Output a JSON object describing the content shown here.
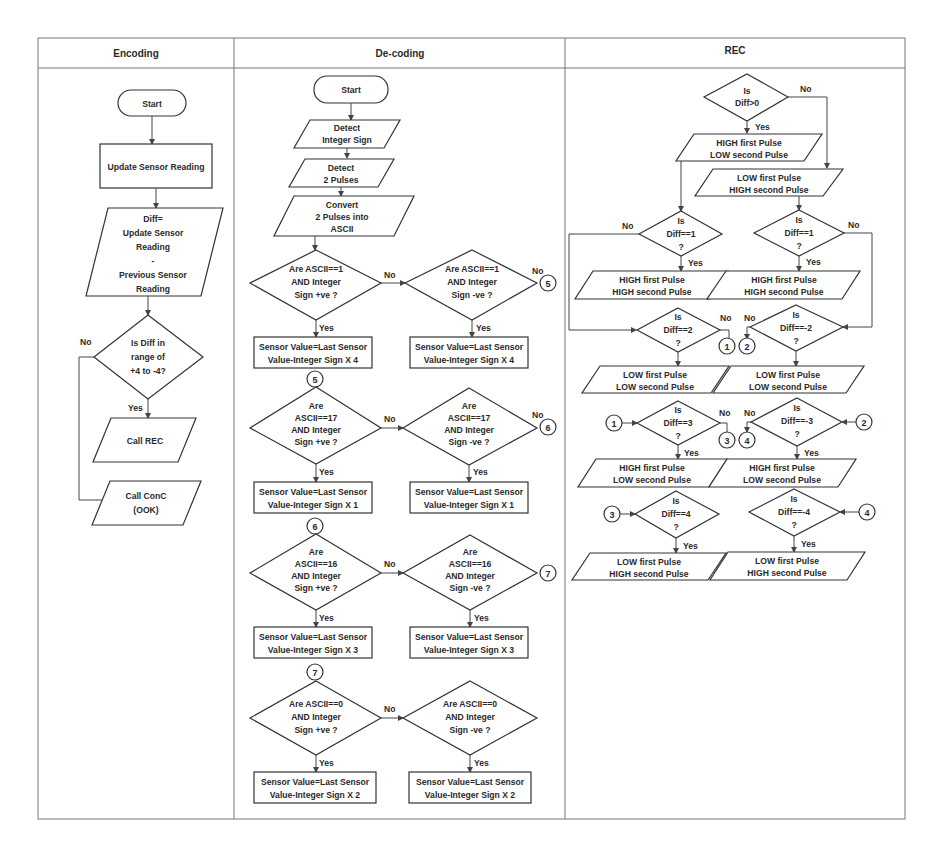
{
  "table": {
    "columns": [
      "Encoding",
      "De-coding",
      "REC"
    ]
  },
  "encoding": {
    "start": "Start",
    "update": "Update Sensor Reading",
    "diff": [
      "Diff=",
      "Update Sensor",
      "Reading",
      "-",
      "Previous Sensor",
      "Reading"
    ],
    "decision": [
      "Is Diff  in",
      "range of",
      "+4 to -4?"
    ],
    "no": "No",
    "yes": "Yes",
    "call_rec": "Call REC",
    "call_conc": [
      "Call ConC",
      "(OOK)"
    ]
  },
  "decoding": {
    "start": "Start",
    "detect_sign": [
      "Detect",
      "Integer Sign"
    ],
    "detect_pulses": [
      "Detect",
      "2 Pulses"
    ],
    "convert": [
      "Convert",
      "2 Pulses into",
      "ASCII"
    ],
    "rows": [
      {
        "connector_in": "",
        "left_decision": [
          "Are ASCII==1",
          "AND Integer",
          "Sign +ve ?"
        ],
        "right_decision": [
          "Are ASCII==1",
          "AND Integer",
          "Sign -ve ?"
        ],
        "left_result": [
          "Sensor Value=Last Sensor",
          "Value-Integer Sign X 4"
        ],
        "right_result": [
          "Sensor Value=Last Sensor",
          "Value-Integer Sign X 4"
        ],
        "connector_out": "5"
      },
      {
        "connector_in": "5",
        "left_decision": [
          "Are",
          "ASCII==17",
          "AND Integer",
          "Sign +ve ?"
        ],
        "right_decision": [
          "Are",
          "ASCII==17",
          "AND Integer",
          "Sign -ve ?"
        ],
        "left_result": [
          "Sensor Value=Last Sensor",
          "Value-Integer Sign X 1"
        ],
        "right_result": [
          "Sensor Value=Last Sensor",
          "Value-Integer Sign X 1"
        ],
        "connector_out": "6"
      },
      {
        "connector_in": "6",
        "left_decision": [
          "Are",
          "ASCII==16",
          "AND Integer",
          "Sign +ve ?"
        ],
        "right_decision": [
          "Are",
          "ASCII==16",
          "AND Integer",
          "Sign -ve ?"
        ],
        "left_result": [
          "Sensor Value=Last Sensor",
          "Value-Integer Sign X 3"
        ],
        "right_result": [
          "Sensor Value=Last Sensor",
          "Value-Integer Sign X 3"
        ],
        "connector_out": "7"
      },
      {
        "connector_in": "7",
        "left_decision": [
          "Are ASCII==0",
          "AND Integer",
          "Sign +ve ?"
        ],
        "right_decision": [
          "Are ASCII==0",
          "AND Integer",
          "Sign -ve ?"
        ],
        "left_result": [
          "Sensor Value=Last Sensor",
          "Value-Integer Sign X 2"
        ],
        "right_result": [
          "Sensor Value=Last Sensor",
          "Value-Integer Sign X 2"
        ],
        "connector_out": ""
      }
    ],
    "yes": "Yes",
    "no": "No"
  },
  "rec": {
    "top_decision": [
      "Is",
      "Diff>0"
    ],
    "high_low": [
      "HIGH first Pulse",
      "LOW second Pulse"
    ],
    "low_high": [
      "LOW first Pulse",
      "HIGH second Pulse"
    ],
    "d_left_1": [
      "Is",
      "Diff==1",
      "?"
    ],
    "d_right_1": [
      "Is",
      "Diff==1",
      "?"
    ],
    "r_left_1": [
      "HIGH first Pulse",
      "HIGH second Pulse"
    ],
    "r_right_1": [
      "HIGH first Pulse",
      "HIGH second Pulse"
    ],
    "d_left_2": [
      "Is",
      "Diff==2",
      "?"
    ],
    "d_right_2": [
      "Is",
      "Diff==-2",
      "?"
    ],
    "r_left_2": [
      "LOW first Pulse",
      "LOW second Pulse"
    ],
    "r_right_2": [
      "LOW first Pulse",
      "LOW second Pulse"
    ],
    "d_left_3": [
      "Is",
      "Diff==3",
      "?"
    ],
    "d_right_3": [
      "Is",
      "Diff==-3",
      "?"
    ],
    "r_left_3": [
      "HIGH first Pulse",
      "LOW second Pulse"
    ],
    "r_right_3": [
      "HIGH first Pulse",
      "LOW second Pulse"
    ],
    "d_left_4": [
      "Is",
      "Diff==4",
      "?"
    ],
    "d_right_4": [
      "Is",
      "Diff==-4",
      "?"
    ],
    "r_left_4": [
      "LOW first Pulse",
      "HIGH second Pulse"
    ],
    "r_right_4": [
      "LOW first Pulse",
      "HIGH second Pulse"
    ],
    "connectors": [
      "1",
      "2",
      "3",
      "4"
    ],
    "yes": "Yes",
    "no": "No"
  }
}
